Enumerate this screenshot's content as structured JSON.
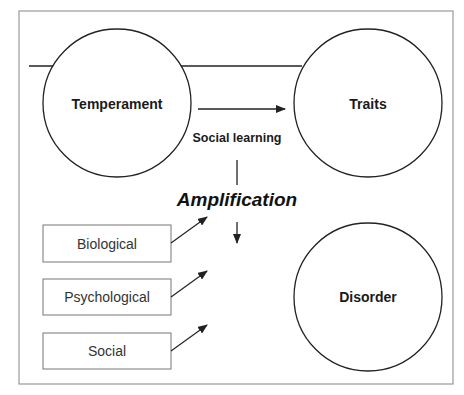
{
  "diagram": {
    "nodes": {
      "temperament": {
        "label": "Temperament"
      },
      "traits": {
        "label": "Traits"
      },
      "disorder": {
        "label": "Disorder"
      }
    },
    "edge_label": "Social learning",
    "process_label": "Amplification",
    "factors": [
      {
        "label": "Biological"
      },
      {
        "label": "Psychological"
      },
      {
        "label": "Social"
      }
    ],
    "colors": {
      "stroke": "#222222",
      "frame": "#9a9a9a",
      "text": "#1a1a1a",
      "factor_text": "#333333"
    }
  }
}
